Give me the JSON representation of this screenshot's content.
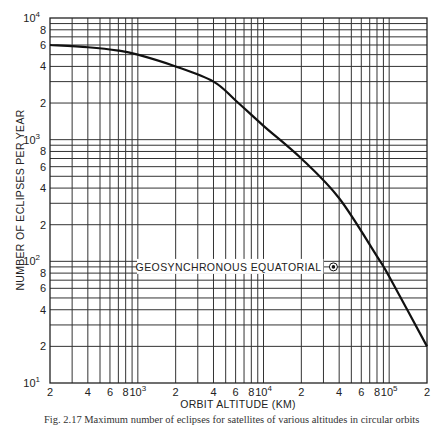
{
  "chart_data": {
    "type": "line",
    "title": "",
    "xlabel": "ORBIT ALTITUDE (KM)",
    "ylabel": "NUMBER OF ECLIPSES PER YEAR",
    "xscale": "log",
    "yscale": "log",
    "xlim": [
      200,
      200000
    ],
    "ylim": [
      10,
      10000
    ],
    "grid": true,
    "x_ticks": [
      {
        "value": 200,
        "label": "2"
      },
      {
        "value": 400,
        "label": "4"
      },
      {
        "value": 600,
        "label": "6"
      },
      {
        "value": 800,
        "label": "8"
      },
      {
        "value": 1000,
        "label": "10",
        "exp": "3"
      },
      {
        "value": 2000,
        "label": "2"
      },
      {
        "value": 4000,
        "label": "4"
      },
      {
        "value": 6000,
        "label": "6"
      },
      {
        "value": 8000,
        "label": "8"
      },
      {
        "value": 10000,
        "label": "10",
        "exp": "4"
      },
      {
        "value": 20000,
        "label": "2"
      },
      {
        "value": 40000,
        "label": "4"
      },
      {
        "value": 60000,
        "label": "6"
      },
      {
        "value": 80000,
        "label": "8"
      },
      {
        "value": 100000,
        "label": "10",
        "exp": "5"
      },
      {
        "value": 200000,
        "label": "2"
      }
    ],
    "y_ticks": [
      {
        "value": 10,
        "label": "10",
        "exp": "1"
      },
      {
        "value": 20,
        "label": "2"
      },
      {
        "value": 40,
        "label": "4"
      },
      {
        "value": 60,
        "label": "6"
      },
      {
        "value": 80,
        "label": "8"
      },
      {
        "value": 100,
        "label": "10",
        "exp": "2"
      },
      {
        "value": 200,
        "label": "2"
      },
      {
        "value": 400,
        "label": "4"
      },
      {
        "value": 600,
        "label": "6"
      },
      {
        "value": 800,
        "label": "8"
      },
      {
        "value": 1000,
        "label": "10",
        "exp": "3"
      },
      {
        "value": 2000,
        "label": "2"
      },
      {
        "value": 4000,
        "label": "4"
      },
      {
        "value": 6000,
        "label": "6"
      },
      {
        "value": 8000,
        "label": "8"
      },
      {
        "value": 10000,
        "label": "10",
        "exp": "4"
      }
    ],
    "series": [
      {
        "name": "Eclipses per year",
        "x": [
          200,
          400,
          700,
          1000,
          2000,
          4000,
          6000,
          10000,
          20000,
          40000,
          80000,
          100000,
          200000
        ],
        "y": [
          6000,
          5750,
          5400,
          5000,
          4000,
          3000,
          2100,
          1300,
          700,
          330,
          110,
          75,
          20
        ]
      }
    ],
    "annotations": [
      {
        "text": "GEOSYNCHRONOUS EQUATORIAL",
        "marker": "circled-dot",
        "x": 36000,
        "y": 90
      }
    ]
  },
  "caption": "Fig. 2.17  Maximum number of eclipses for satellites of various altitudes in circular orbits"
}
